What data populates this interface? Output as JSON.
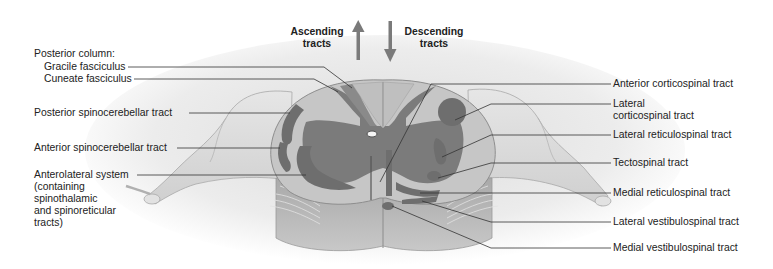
{
  "figure": {
    "direction_headers": {
      "ascending": [
        "Ascending",
        "tracts"
      ],
      "descending": [
        "Descending",
        "tracts"
      ]
    },
    "left_labels": {
      "posterior_column_heading": "Posterior column:",
      "gracile": "Gracile fasciculus",
      "cuneate": "Cuneate fasciculus",
      "posterior_spinocerebellar": "Posterior spinocerebellar tract",
      "anterior_spinocerebellar": "Anterior spinocerebellar tract",
      "anterolateral": [
        "Anterolateral system",
        "(containing",
        "spinothalamic",
        "and spinoreticular",
        "tracts)"
      ]
    },
    "right_labels": {
      "anterior_corticospinal": "Anterior corticospinal tract",
      "lateral_corticospinal": [
        "Lateral",
        "corticospinal tract"
      ],
      "lateral_reticulospinal": "Lateral reticulospinal tract",
      "tectospinal": "Tectospinal tract",
      "medial_reticulospinal": "Medial reticulospinal tract",
      "lateral_vestibulospinal": "Lateral vestibulospinal tract",
      "medial_vestibulospinal": "Medial vestibulospinal tract"
    },
    "colors": {
      "white_matter": "#c9c9c9",
      "gray_matter": "#7b7b7b",
      "tract_dark": "#6e6e6e",
      "nerve_root": "#d8d8d8",
      "arrow": "#7a7a7a",
      "leader_line": "#333333"
    }
  }
}
